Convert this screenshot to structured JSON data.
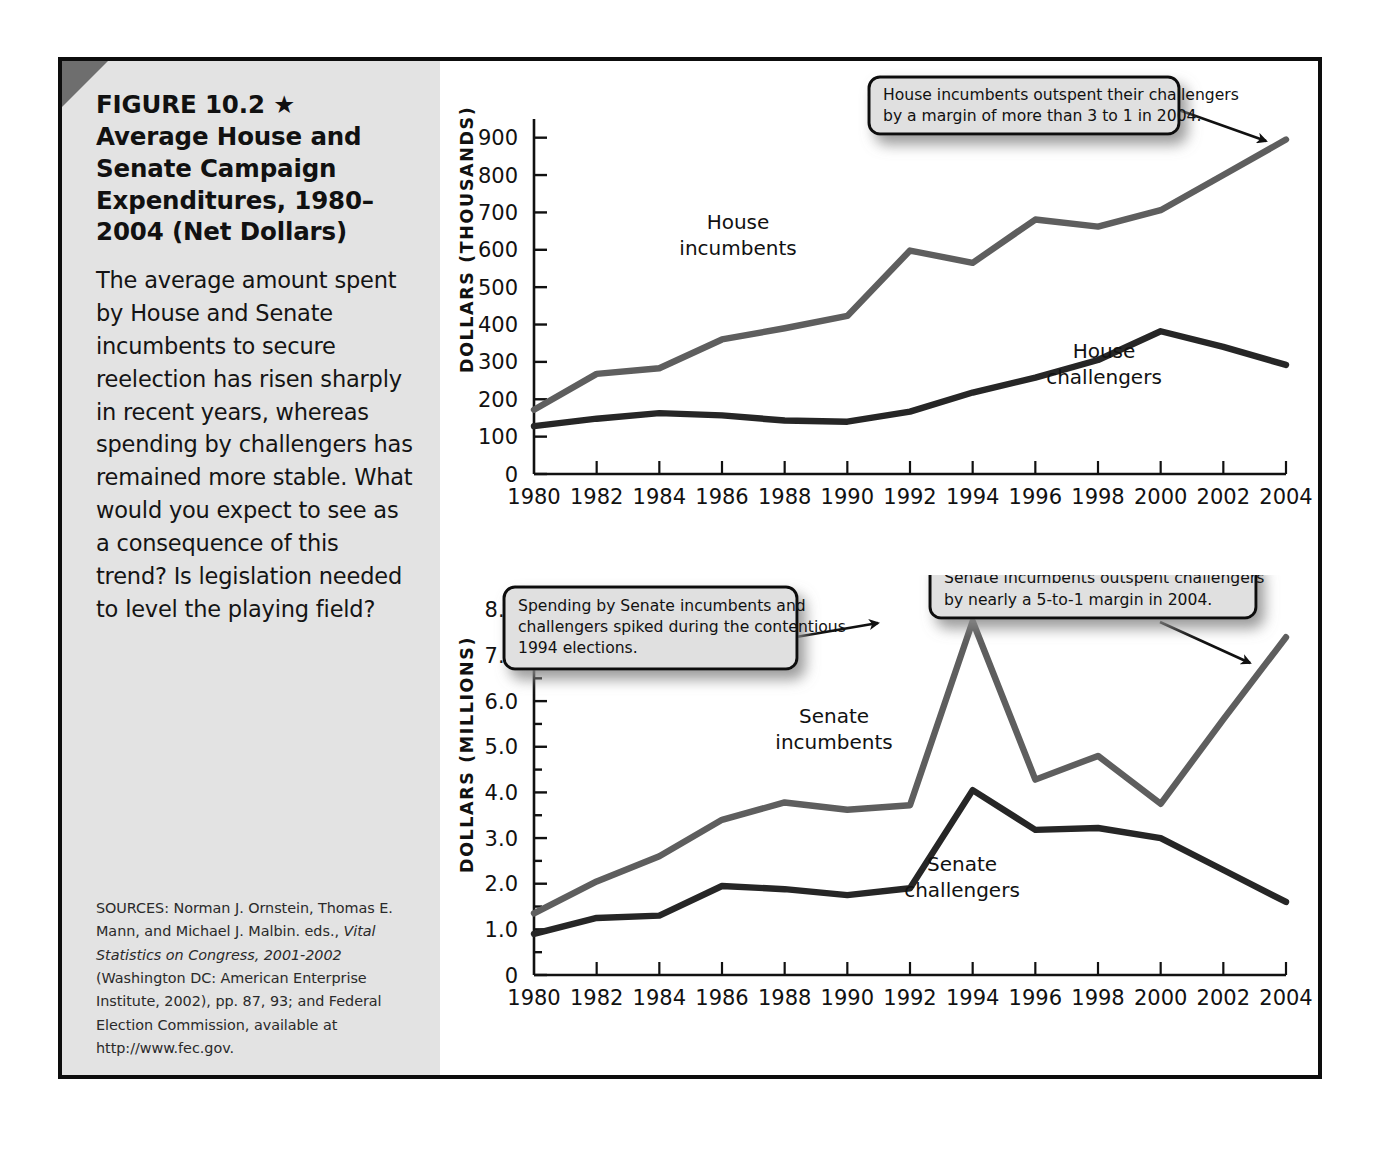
{
  "figure": {
    "title": "FIGURE 10.2 ★\nAverage House and\nSenate Campaign\nExpenditures, 1980–\n2004 (Net Dollars)",
    "title_line1": "FIGURE 10.2",
    "star_glyph": "★",
    "caption": "The average amount spent by House and Senate incumbents to secure reelection has risen sharply in recent years, whereas spending by challengers has remained more stable. What would you expect to see as a consequence of this trend? Is legislation needed to level the playing field?",
    "sources_pre": "SOURCES: Norman J. Ornstein, Thomas E. Mann, and Michael J. Malbin. eds., ",
    "sources_italic": "Vital Statistics on Congress, 2001-2002",
    "sources_post": " (Washington DC: American Enterprise Institute, 2002), pp. 87, 93; and Federal Election Commission, available at http://www.fec.gov."
  },
  "colors": {
    "incumbent_line": "#5e5e5e",
    "challenger_line": "#262626",
    "sidebar_bg": "#e3e3e3",
    "frame": "#0d0d0d",
    "callout_bg": "#e0e0e0",
    "corner_wedge": "#6e6e6e"
  },
  "chart_data": [
    {
      "id": "house",
      "type": "line",
      "title": "Average House Campaign Expenditures, 1980-2004 (Net Dollars)",
      "xlabel": "",
      "ylabel": "DOLLARS (THOUSANDS)",
      "x": [
        1980,
        1982,
        1984,
        1986,
        1988,
        1990,
        1992,
        1994,
        1996,
        1998,
        2000,
        2002,
        2004
      ],
      "xticklabels": [
        "1980",
        "1982",
        "1984",
        "1986",
        "1988",
        "1990",
        "1992",
        "1994",
        "1996",
        "1998",
        "2000",
        "2002",
        "2004"
      ],
      "yticklabels": [
        "0",
        "100",
        "200",
        "300",
        "400",
        "500",
        "600",
        "700",
        "800",
        "900"
      ],
      "ylim": [
        0,
        950
      ],
      "xlim": [
        1980,
        2004
      ],
      "grid": false,
      "legend": "inline-labels",
      "series": [
        {
          "name": "House incumbents",
          "color": "#5e5e5e",
          "values": [
            172,
            268,
            283,
            360,
            390,
            423,
            598,
            565,
            681,
            662,
            706,
            800,
            895
          ]
        },
        {
          "name": "House challengers",
          "color": "#262626",
          "values": [
            128,
            148,
            163,
            157,
            143,
            140,
            167,
            218,
            258,
            305,
            382,
            340,
            292
          ]
        }
      ],
      "annotations": [
        {
          "id": "house-callout",
          "text": "House incumbents outspent their challengers by a margin of more than 3 to 1 in 2004.",
          "lines": [
            "House incumbents outspent their challengers",
            "by a margin of more than 3 to 1 in 2004."
          ],
          "points_to": "2004 House incumbents"
        }
      ]
    },
    {
      "id": "senate",
      "type": "line",
      "title": "Average Senate Campaign Expenditures, 1980-2004 (Net Dollars)",
      "xlabel": "",
      "ylabel": "DOLLARS (MILLIONS)",
      "x": [
        1980,
        1982,
        1984,
        1986,
        1988,
        1990,
        1992,
        1994,
        1996,
        1998,
        2000,
        2002,
        2004
      ],
      "xticklabels": [
        "1980",
        "1982",
        "1984",
        "1986",
        "1988",
        "1990",
        "1992",
        "1994",
        "1996",
        "1998",
        "2000",
        "2002",
        "2004"
      ],
      "yticklabels": [
        "0",
        "1.0",
        "2.0",
        "3.0",
        "4.0",
        "5.0",
        "6.0",
        "7.0",
        "8.0"
      ],
      "ylim": [
        0,
        8.5
      ],
      "xlim": [
        1980,
        2004
      ],
      "grid": false,
      "legend": "inline-labels",
      "series": [
        {
          "name": "Senate incumbents",
          "color": "#5e5e5e",
          "values": [
            1.35,
            2.05,
            2.6,
            3.4,
            3.78,
            3.62,
            3.72,
            7.75,
            4.28,
            4.8,
            3.75,
            5.6,
            7.4
          ]
        },
        {
          "name": "Senate challengers",
          "color": "#262626",
          "values": [
            0.9,
            1.25,
            1.3,
            1.95,
            1.88,
            1.75,
            1.9,
            4.05,
            3.18,
            3.22,
            3.0,
            2.3,
            1.6
          ]
        }
      ],
      "annotations": [
        {
          "id": "senate-callout-1994",
          "text": "Spending by Senate incumbents and challengers spiked during the contentious 1994 elections.",
          "lines": [
            "Spending by Senate incumbents and",
            "challengers spiked during the contentious",
            "1994 elections."
          ],
          "points_to": "1994 Senate incumbents"
        },
        {
          "id": "senate-callout-2004",
          "text": "Senate incumbents outspent challengers by nearly a 5-to-1 margin in 2004.",
          "lines": [
            "Senate incumbents outspent challengers",
            "by nearly a 5-to-1 margin in 2004."
          ],
          "points_to": "2004 Senate incumbents"
        }
      ]
    }
  ]
}
